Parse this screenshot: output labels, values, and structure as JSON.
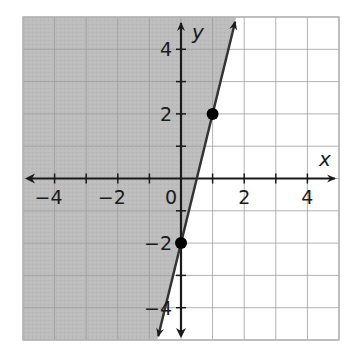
{
  "chart_data": {
    "type": "line",
    "subtype": "linear-inequality-graph",
    "title": "",
    "xlabel": "x",
    "ylabel": "y",
    "xlim": [
      -5,
      5
    ],
    "ylim": [
      -5,
      5
    ],
    "grid": true,
    "grid_step": 1,
    "x_tick_labels": [
      "-4",
      "-2",
      "0",
      "2",
      "4"
    ],
    "x_tick_values": [
      -4,
      -2,
      0,
      2,
      4
    ],
    "y_tick_labels": [
      "4",
      "2",
      "-2",
      "-4"
    ],
    "y_tick_values": [
      4,
      2,
      -2,
      -4
    ],
    "boundary_line": {
      "equation": "y = 4x - 2",
      "slope": 4,
      "intercept": -2,
      "style": "solid",
      "arrows": "both"
    },
    "points": [
      {
        "x": 0,
        "y": -2
      },
      {
        "x": 1,
        "y": 2
      }
    ],
    "shaded_region": "left/above the line (y >= 4x - 2)",
    "inequality": "y ≥ 4x − 2",
    "colors": {
      "shade": "#bdbdbd",
      "grid": "#9a9a9a",
      "grid_light": "#cfcfcf",
      "axis": "#1a1a1a",
      "line": "#333333",
      "point": "#000000"
    }
  }
}
